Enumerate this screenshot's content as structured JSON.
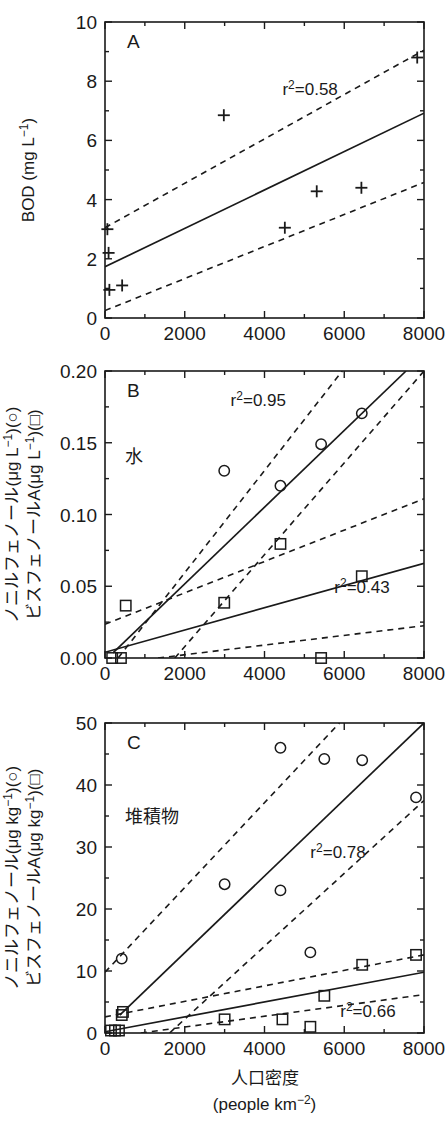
{
  "figure": {
    "title_visible": false,
    "panel_count": 3,
    "xaxis_title_main": "人口密度",
    "xaxis_title_units": "(people km",
    "xaxis_title_units_sup": "−2",
    "xaxis_title_units_close": ")"
  },
  "shared_x": {
    "label_main": "人口密度",
    "label_units": "(people km⁻²)",
    "ticks": [
      0,
      2000,
      4000,
      6000,
      8000
    ],
    "tick_labels": [
      "0",
      "2000",
      "4000",
      "6000",
      "8000"
    ],
    "min": 0,
    "max": 8000,
    "minor_ticks": [
      1000,
      3000,
      5000,
      7000
    ]
  },
  "panels": [
    {
      "id": "A",
      "letter": "A",
      "inner_label": "",
      "ylabel_parts": [
        "BOD (mg L",
        "−1",
        ")"
      ],
      "ylabel_plain": "BOD (mg L⁻¹)",
      "y_ticks": [
        0,
        2,
        4,
        6,
        8,
        10
      ],
      "y_tick_labels": [
        "0",
        "2",
        "4",
        "6",
        "8",
        "10"
      ],
      "y_min": 0,
      "y_max": 10,
      "y_minor": [
        1,
        3,
        5,
        7,
        9
      ],
      "annotations": [
        {
          "name": "r2-a",
          "text_pre": "r",
          "text_sup": "2",
          "text_post": "=0.58",
          "text_plain": "r²=0.58",
          "x": 4450,
          "y": 7.55
        }
      ],
      "series": [
        {
          "name": "BOD",
          "marker": "plus",
          "points": [
            {
              "x": 60,
              "y": 3.0
            },
            {
              "x": 90,
              "y": 2.2
            },
            {
              "x": 110,
              "y": 0.95
            },
            {
              "x": 430,
              "y": 1.1
            },
            {
              "x": 2980,
              "y": 6.85
            },
            {
              "x": 4510,
              "y": 3.05
            },
            {
              "x": 5310,
              "y": 4.28
            },
            {
              "x": 6430,
              "y": 4.4
            },
            {
              "x": 7830,
              "y": 8.8
            }
          ]
        }
      ],
      "fits": [
        {
          "name": "regression-a",
          "style": "solid",
          "x0": 0,
          "y0": 1.73,
          "x1": 8000,
          "y1": 6.92
        }
      ],
      "ci_bands": [
        {
          "name": "ci-upper-a",
          "style": "dashed",
          "x0": 0,
          "y0": 3.05,
          "x1": 8000,
          "y1": 9.05
        },
        {
          "name": "ci-lower-a",
          "style": "dashed",
          "x0": 0,
          "y0": 0.25,
          "x1": 8000,
          "y1": 4.58
        }
      ]
    },
    {
      "id": "B",
      "letter": "B",
      "inner_label": "水",
      "ylabel_line1_parts": [
        "ノニルフェノール(μg L",
        "−1",
        ")(○)"
      ],
      "ylabel_line2_parts": [
        "ビスフェノールA(μg L",
        "−1",
        ")(□)"
      ],
      "ylabel_plain_1": "ノニルフェノール(μg L⁻¹)(○)",
      "ylabel_plain_2": "ビスフェノールA(μg L⁻¹)(□)",
      "y_ticks": [
        0.0,
        0.05,
        0.1,
        0.15,
        0.2
      ],
      "y_tick_labels": [
        "0.00",
        "0.05",
        "0.10",
        "0.15",
        "0.20"
      ],
      "y_min": 0,
      "y_max": 0.2,
      "y_minor": [
        0.025,
        0.075,
        0.125,
        0.175
      ],
      "annotations": [
        {
          "name": "r2-b-circle",
          "text_pre": "r",
          "text_sup": "2",
          "text_post": "=0.95",
          "text_plain": "r²=0.95",
          "x": 3150,
          "y": 0.1755
        },
        {
          "name": "r2-b-square",
          "text_pre": "r",
          "text_sup": "2",
          "text_post": "=0.43",
          "text_plain": "r²=0.43",
          "x": 5750,
          "y": 0.0455
        }
      ],
      "series": [
        {
          "name": "nonylphenol-water",
          "marker": "circle",
          "points": [
            {
              "x": 2990,
              "y": 0.1305
            },
            {
              "x": 4400,
              "y": 0.12
            },
            {
              "x": 5420,
              "y": 0.149
            },
            {
              "x": 6440,
              "y": 0.1705
            }
          ]
        },
        {
          "name": "bisphenolA-water",
          "marker": "square",
          "points": [
            {
              "x": 180,
              "y": 0.0
            },
            {
              "x": 400,
              "y": 0.0
            },
            {
              "x": 520,
              "y": 0.0365
            },
            {
              "x": 2990,
              "y": 0.0385
            },
            {
              "x": 4400,
              "y": 0.0795
            },
            {
              "x": 5420,
              "y": 0.0
            },
            {
              "x": 6440,
              "y": 0.057
            }
          ]
        }
      ],
      "fits": [
        {
          "name": "regression-b-circle",
          "style": "solid",
          "x0": 200,
          "y0": 0.0035,
          "x1": 7550,
          "y1": 0.2
        },
        {
          "name": "regression-b-square",
          "style": "solid",
          "x0": 0,
          "y0": 0.004,
          "x1": 8000,
          "y1": 0.066
        }
      ],
      "ci_bands": [
        {
          "name": "ci-upper-b-circle",
          "style": "dashed",
          "x0": 330,
          "y0": 0.0,
          "x1": 5950,
          "y1": 0.2
        },
        {
          "name": "ci-lower-b-circle",
          "style": "dashed",
          "x0": 1750,
          "y0": 0.0,
          "x1": 8000,
          "y1": 0.2
        },
        {
          "name": "ci-upper-b-square",
          "style": "dashed",
          "x0": 0,
          "y0": 0.0235,
          "x1": 8000,
          "y1": 0.111
        },
        {
          "name": "ci-lower-b-square",
          "style": "dashed",
          "x0": 1330,
          "y0": 0.0,
          "x1": 8000,
          "y1": 0.0225
        }
      ]
    },
    {
      "id": "C",
      "letter": "C",
      "inner_label": "堆積物",
      "ylabel_line1_parts": [
        "ノニルフェノール(μg kg",
        "−1",
        ")(○)"
      ],
      "ylabel_line2_parts": [
        "ビスフェノールA(μg kg",
        "−1",
        ")(□)"
      ],
      "ylabel_plain_1": "ノニルフェノール(μg kg⁻¹)(○)",
      "ylabel_plain_2": "ビスフェノールA(μg kg⁻¹)(□)",
      "y_ticks": [
        0,
        10,
        20,
        30,
        40,
        50
      ],
      "y_tick_labels": [
        "0",
        "10",
        "20",
        "30",
        "40",
        "50"
      ],
      "y_min": 0,
      "y_max": 50,
      "y_minor": [
        5,
        15,
        25,
        35,
        45
      ],
      "annotations": [
        {
          "name": "r2-c-circle",
          "text_pre": "r",
          "text_sup": "2",
          "text_post": "=0.78",
          "text_plain": "r²=0.78",
          "x": 5150,
          "y": 28.3
        },
        {
          "name": "r2-c-square",
          "text_pre": "r",
          "text_sup": "2",
          "text_post": "=0.66",
          "text_plain": "r²=0.66",
          "x": 5900,
          "y": 2.6
        }
      ],
      "series": [
        {
          "name": "nonylphenol-sediment",
          "marker": "circle",
          "points": [
            {
              "x": 420,
              "y": 12.0
            },
            {
              "x": 3000,
              "y": 24.0
            },
            {
              "x": 4400,
              "y": 23.0
            },
            {
              "x": 4400,
              "y": 46.0
            },
            {
              "x": 5150,
              "y": 13.0
            },
            {
              "x": 5500,
              "y": 44.2
            },
            {
              "x": 6450,
              "y": 44.0
            },
            {
              "x": 7800,
              "y": 38.0
            }
          ]
        },
        {
          "name": "bisphenolA-sediment",
          "marker": "square",
          "points": [
            {
              "x": 150,
              "y": 0.4
            },
            {
              "x": 250,
              "y": 0.4
            },
            {
              "x": 350,
              "y": 0.4
            },
            {
              "x": 420,
              "y": 2.9
            },
            {
              "x": 450,
              "y": 3.4
            },
            {
              "x": 3000,
              "y": 2.2
            },
            {
              "x": 4450,
              "y": 2.2
            },
            {
              "x": 5150,
              "y": 1.0
            },
            {
              "x": 5500,
              "y": 6.0
            },
            {
              "x": 6450,
              "y": 11.0
            },
            {
              "x": 7800,
              "y": 12.6
            }
          ]
        }
      ],
      "fits": [
        {
          "name": "regression-c-circle",
          "style": "solid",
          "x0": 370,
          "y0": 2.9,
          "x1": 8000,
          "y1": 50.0
        },
        {
          "name": "regression-c-square",
          "style": "solid",
          "x0": 0,
          "y0": 0.2,
          "x1": 8000,
          "y1": 9.8
        }
      ],
      "ci_bands": [
        {
          "name": "ci-upper-c-circle",
          "style": "dashed",
          "x0": 0,
          "y0": 9.8,
          "x1": 5880,
          "y1": 50.0
        },
        {
          "name": "ci-lower-c-circle",
          "style": "dashed",
          "x0": 1620,
          "y0": 0.0,
          "x1": 8000,
          "y1": 37.5
        },
        {
          "name": "ci-upper-c-square",
          "style": "dashed",
          "x0": 0,
          "y0": 2.6,
          "x1": 8000,
          "y1": 12.6
        },
        {
          "name": "ci-lower-c-square",
          "style": "dashed",
          "x0": 900,
          "y0": 0.0,
          "x1": 8000,
          "y1": 6.2
        }
      ]
    }
  ]
}
